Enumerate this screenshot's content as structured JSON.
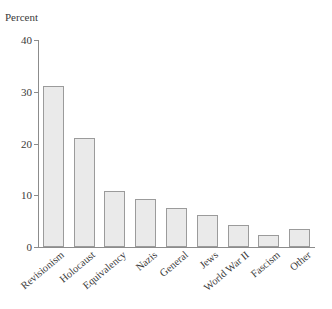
{
  "chart_data": {
    "type": "bar",
    "title": "",
    "subtitle": "",
    "xlabel": "",
    "ylabel": "Percent",
    "ylim": [
      0,
      40
    ],
    "yticks": [
      0,
      10,
      20,
      30,
      40
    ],
    "ytick_labels": [
      "0",
      "10",
      "20",
      "30",
      "40"
    ],
    "grid": false,
    "legend": false,
    "legend_position": "none",
    "categories": [
      "Revisionism",
      "Holocaust",
      "Equivalency",
      "Nazis",
      "General",
      "Jews",
      "World War II",
      "Fascism",
      "Other"
    ],
    "values": [
      31.2,
      21.0,
      10.8,
      9.2,
      7.6,
      6.2,
      4.2,
      2.4,
      3.4
    ],
    "bar_color": "#eaeaea",
    "bar_edge_color": "#9b9b9b",
    "axis_color": "#8c8c8c",
    "text_color": "#3a3a3a",
    "background": "#ffffff",
    "label_rotation": -40
  }
}
